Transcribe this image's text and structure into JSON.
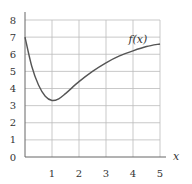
{
  "chart_data": {
    "type": "line",
    "title": "",
    "xlabel": "x",
    "ylabel": "",
    "xlim": [
      0,
      5
    ],
    "ylim": [
      0,
      8
    ],
    "grid": true,
    "x_ticks": [
      "1",
      "2",
      "3",
      "4",
      "5"
    ],
    "y_ticks": [
      "0",
      "1",
      "2",
      "3",
      "4",
      "5",
      "6",
      "7",
      "8"
    ],
    "series": [
      {
        "name": "f(x)",
        "x": [
          0,
          0.25,
          0.5,
          0.75,
          1.0,
          1.25,
          1.5,
          2.0,
          2.5,
          3.0,
          3.5,
          4.0,
          4.5,
          5.0
        ],
        "y": [
          7.0,
          5.3,
          4.2,
          3.55,
          3.3,
          3.4,
          3.7,
          4.4,
          5.0,
          5.5,
          5.9,
          6.2,
          6.45,
          6.6
        ]
      }
    ],
    "annotations": [
      {
        "text": "f(x)",
        "x": 4.2,
        "y": 6.9
      }
    ],
    "legend": "none"
  }
}
